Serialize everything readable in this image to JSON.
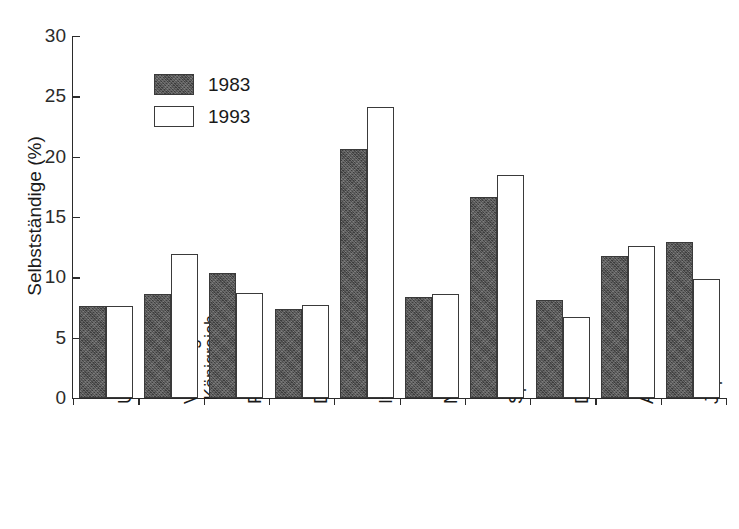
{
  "chart_data": {
    "type": "bar",
    "title": "",
    "xlabel": "",
    "ylabel": "Selbstständige (%)",
    "ylim": [
      0,
      30
    ],
    "yticks": [
      0,
      5,
      10,
      15,
      20,
      25,
      30
    ],
    "ytick_labels": [
      "0",
      "5",
      "10",
      "15",
      "20",
      "25",
      "30"
    ],
    "grid": false,
    "legend_position": "upper-left-inside",
    "categories": [
      "USA",
      "Vereinigtes Königreich",
      "Frankreich",
      "Deutschland",
      "Italien",
      "Niederlande",
      "Spanien",
      "Dänemark",
      "Australien",
      "Japan"
    ],
    "category_lines": [
      [
        "USA"
      ],
      [
        "Vereinigtes",
        "Königreich"
      ],
      [
        "Frankreich"
      ],
      [
        "Deutschland"
      ],
      [
        "Italien"
      ],
      [
        "Niederlande"
      ],
      [
        "Spanien"
      ],
      [
        "Dänemark"
      ],
      [
        "Australien"
      ],
      [
        "Japan"
      ]
    ],
    "series": [
      {
        "name": "1983",
        "color": "#4c4c4c",
        "values": [
          7.6,
          8.6,
          10.4,
          7.4,
          20.6,
          8.4,
          16.7,
          8.1,
          11.8,
          12.9
        ]
      },
      {
        "name": "1993",
        "color": "#ffffff",
        "values": [
          7.6,
          11.9,
          8.7,
          7.7,
          24.1,
          8.6,
          18.5,
          6.7,
          12.6,
          9.9
        ]
      }
    ]
  },
  "legend": {
    "items": [
      {
        "label": "1983",
        "style": "s1983"
      },
      {
        "label": "1993",
        "style": "s1993"
      }
    ]
  },
  "axes": {
    "y_title": "Selbstständige (%)"
  },
  "header": {
    "title_fragment": ""
  }
}
